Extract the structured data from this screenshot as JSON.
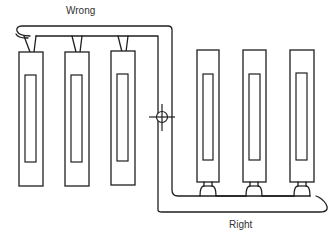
{
  "labels": {
    "wrong": "Wrong",
    "right": "Right"
  },
  "diagram": {
    "type": "radiator piping layout comparison",
    "groups": [
      {
        "label": "Wrong",
        "radiator_count": 3,
        "connection": "top-connected branches from a supply loop"
      },
      {
        "label": "Right",
        "radiator_count": 3,
        "connection": "bottom-connected with reverse-return loop"
      }
    ],
    "symbols": [
      {
        "name": "crosshair-valve",
        "description": "circle with crossing lines at pipe junction"
      }
    ],
    "colors": {
      "line": "#1f1f1f",
      "background": "#ffffff",
      "text": "#333333"
    }
  }
}
